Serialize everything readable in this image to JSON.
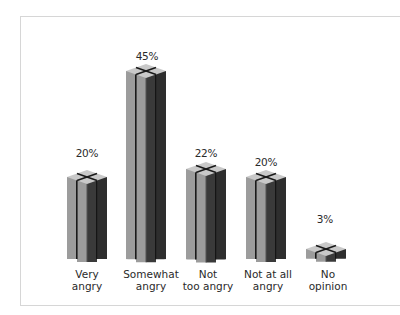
{
  "chart_data": {
    "type": "bar",
    "style": "3d-pictogram-columns",
    "title": "",
    "xlabel": "",
    "ylabel": "",
    "categories": [
      "Very angry",
      "Somewhat angry",
      "Not too angry",
      "Not at all angry",
      "No opinion"
    ],
    "category_lines": [
      [
        "Very",
        "angry"
      ],
      [
        "Somewhat",
        "angry"
      ],
      [
        "Not",
        "too angry"
      ],
      [
        "Not at all",
        "angry"
      ],
      [
        "No",
        "opinion"
      ]
    ],
    "values": [
      20,
      45,
      22,
      20,
      3
    ],
    "value_labels": [
      "20%",
      "45%",
      "22%",
      "20%",
      "3%"
    ],
    "unit": "%",
    "grid": false,
    "legend": null,
    "colors": {
      "light_face": "#9c9c9c",
      "dark_face": "#3a3a3a",
      "top_face": "#c9c9c9",
      "gap": "#1a1a1a"
    }
  },
  "bars": [
    {
      "label_1": "Very",
      "label_2": "angry",
      "value": "20%"
    },
    {
      "label_1": "Somewhat",
      "label_2": "angry",
      "value": "45%"
    },
    {
      "label_1": "Not",
      "label_2": "too angry",
      "value": "22%"
    },
    {
      "label_1": "Not at all",
      "label_2": "angry",
      "value": "20%"
    },
    {
      "label_1": "No",
      "label_2": "opinion",
      "value": "3%"
    }
  ]
}
